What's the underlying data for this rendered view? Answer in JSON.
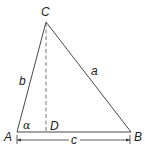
{
  "diagram": {
    "type": "triangle",
    "vertices": {
      "A": {
        "label": "A",
        "x": 17,
        "y": 132
      },
      "B": {
        "label": "B",
        "x": 131,
        "y": 132
      },
      "C": {
        "label": "C",
        "x": 46,
        "y": 22
      }
    },
    "foot": {
      "label": "D",
      "x": 46,
      "y": 132
    },
    "sides": {
      "a": "a",
      "b": "b",
      "c": "c"
    },
    "angle": {
      "label": "α",
      "vertex": "A"
    },
    "colors": {
      "stroke": "#333333",
      "dashed": "#666666",
      "text": "#222222"
    }
  }
}
